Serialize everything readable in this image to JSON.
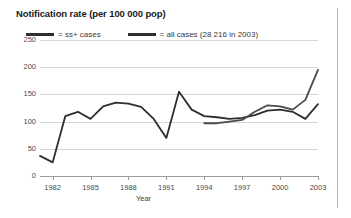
{
  "chart_data": {
    "type": "line",
    "title": "Notification rate (per 100 000 pop)",
    "xlabel": "Year",
    "ylabel": "",
    "xlim": [
      1981,
      2003
    ],
    "ylim": [
      0,
      250
    ],
    "grid": true,
    "legend_position": "top-left",
    "y_ticks": [
      "0",
      "50",
      "100",
      "150",
      "200",
      "250"
    ],
    "y_tick_values": [
      0,
      50,
      100,
      150,
      200,
      250
    ],
    "x_ticks": [
      "1982",
      "1985",
      "1988",
      "1991",
      "1994",
      "1997",
      "2000",
      "2003"
    ],
    "x_tick_values": [
      1982,
      1985,
      1988,
      1991,
      1994,
      1997,
      2000,
      2003
    ],
    "series": [
      {
        "name": "ss+ cases",
        "legend_label": "= ss+ cases",
        "color": "#2e2e2e",
        "x": [
          1981,
          1982,
          1983,
          1984,
          1985,
          1986,
          1987,
          1988,
          1989,
          1990,
          1991,
          1992,
          1993,
          1994,
          1995,
          1996,
          1997,
          1998,
          1999,
          2000,
          2001,
          2002,
          2003
        ],
        "values": [
          37,
          25,
          110,
          118,
          105,
          128,
          135,
          133,
          127,
          105,
          70,
          155,
          122,
          110,
          108,
          105,
          107,
          112,
          120,
          122,
          118,
          105,
          132
        ]
      },
      {
        "name": "all cases",
        "legend_label": "= all cases (28 216 in 2003)",
        "color": "#4a4a4a",
        "note": "28 216 in 2003",
        "x": [
          1994,
          1995,
          1996,
          1997,
          1998,
          1999,
          2000,
          2001,
          2002,
          2003
        ],
        "values": [
          97,
          97,
          100,
          103,
          118,
          130,
          128,
          122,
          140,
          195
        ]
      }
    ]
  },
  "legend": {
    "items": [
      {
        "label": "= ss+ cases"
      },
      {
        "label": "= all cases (28 216 in 2003)"
      }
    ]
  },
  "axes": {
    "x_title": "Year"
  }
}
